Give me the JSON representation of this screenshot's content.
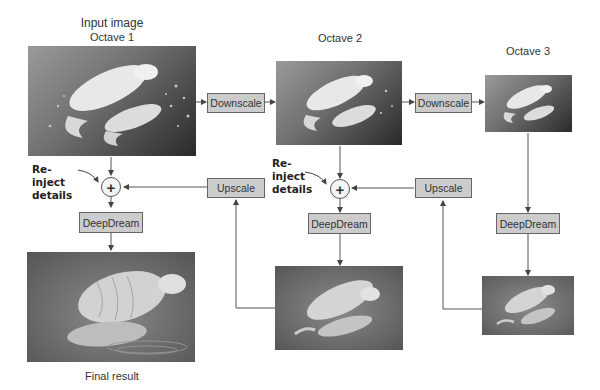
{
  "labels": {
    "input_image": "Input image",
    "octave1": "Octave 1",
    "octave2": "Octave 2",
    "octave3": "Octave 3",
    "final_result": "Final result",
    "reinject_left": "Re-inject details",
    "reinject_mid": "Re-inject details"
  },
  "boxes": {
    "downscale1": "Downscale",
    "downscale2": "Downscale",
    "upscale1": "Upscale",
    "upscale2": "Upscale",
    "deepdream1": "DeepDream",
    "deepdream2": "DeepDream",
    "deepdream3": "DeepDream"
  },
  "operators": {
    "plus1": "+",
    "plus2": "+"
  },
  "colors": {
    "box_fill": "#cccccc",
    "box_border": "#666666",
    "wire": "#555555"
  }
}
